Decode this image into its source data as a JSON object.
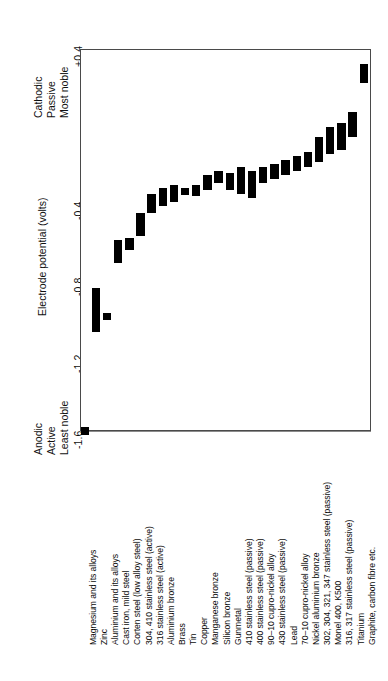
{
  "chart_data": {
    "type": "bar",
    "title": "",
    "subtitle": "",
    "xlabel": "",
    "ylabel": "Electrode potential (volts)",
    "ylim": [
      -1.8,
      0.4
    ],
    "yticks": [
      0.4,
      -0.4,
      -0.8,
      -1.2,
      -1.6
    ],
    "ytick_labels": [
      "+0.4",
      "-0.4",
      "-0.8",
      "-1.2",
      "-1.6"
    ],
    "gridlines": [
      0.4,
      0.0,
      -0.4,
      -0.8,
      -1.2,
      -1.6
    ],
    "grid": true,
    "legend": "none",
    "orientation": "vertical",
    "bar_style": "floating-range",
    "annotations": {
      "top_left": [
        "Cathodic",
        "Passive",
        "Most noble"
      ],
      "bottom_left": [
        "Anodic",
        "Active",
        "Least noble"
      ]
    },
    "categories": [
      "Magnesium and its alloys",
      "Zinc",
      "Aluminium and its alloys",
      "Cast iron, mild steel",
      "Corten steel (low alloy steel)",
      "304, 410 stainless steel (active)",
      "316 stainless steel (active)",
      "Aluminium bronze",
      "Brass",
      "Tin",
      "Copper",
      "Manganese bronze",
      "Silicon bronze",
      "Gunmetal",
      "410 stainless steel  (passive)",
      "400 stainless steel (passive)",
      "90–10 cupro-nickel alloy",
      "430 stainless steel (passive)",
      "Lead",
      "70–10 cupro-nickel alloy",
      "Nickel aluminium bronze",
      "302, 304, 321, 347 stainless steel (passive)",
      "Monel 400, K500",
      "316, 317 stainless steel (passive)",
      "Titanium",
      "Graphite, carbon fibre etc."
    ],
    "ranges": [
      [
        -1.62,
        -1.58
      ],
      [
        -1.08,
        -0.85
      ],
      [
        -1.0,
        -0.98
      ],
      [
        -0.72,
        -0.6
      ],
      [
        -0.65,
        -0.59
      ],
      [
        -0.58,
        -0.46
      ],
      [
        -0.46,
        -0.36
      ],
      [
        -0.42,
        -0.33
      ],
      [
        -0.4,
        -0.31
      ],
      [
        -0.36,
        -0.33
      ],
      [
        -0.37,
        -0.31
      ],
      [
        -0.34,
        -0.26
      ],
      [
        -0.3,
        -0.24
      ],
      [
        -0.34,
        -0.25
      ],
      [
        -0.36,
        -0.22
      ],
      [
        -0.38,
        -0.24
      ],
      [
        -0.3,
        -0.22
      ],
      [
        -0.28,
        -0.2
      ],
      [
        -0.26,
        -0.18
      ],
      [
        -0.24,
        -0.16
      ],
      [
        -0.22,
        -0.14
      ],
      [
        -0.19,
        -0.06
      ],
      [
        -0.15,
        -0.01
      ],
      [
        -0.13,
        0.01
      ],
      [
        -0.06,
        0.07
      ],
      [
        0.22,
        0.32
      ]
    ],
    "units": "volts",
    "bar_color": "#000000",
    "axis_color": "#4a4a4a",
    "grid_color": "#8b8b8b"
  }
}
